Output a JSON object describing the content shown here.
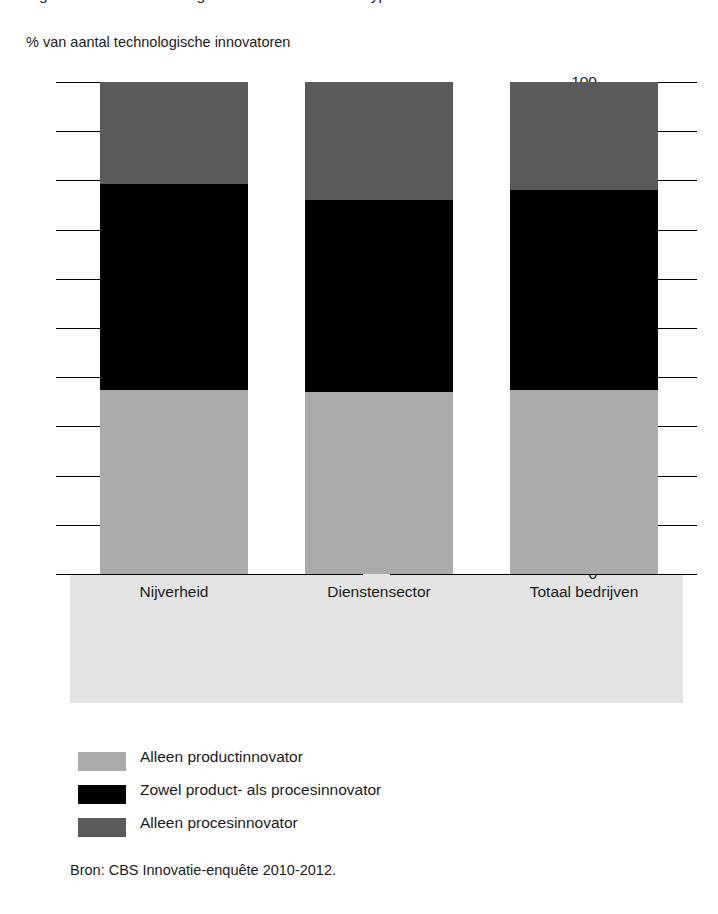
{
  "top_clipped_line": "Figuur: aandeel technologische innovatoren naar type innovatie",
  "axis_caption": "% van aantal technologische innovatoren",
  "source_note": "Bron: CBS Innovatie-enquête 2010-2012.",
  "colors": {
    "product_only": "#aaaaaa",
    "both": "#000000",
    "process_only": "#5a5a5a",
    "panel_background": "#e3e3e3",
    "axis": "#000000"
  },
  "legend": {
    "position": "bottom-left",
    "items": [
      {
        "label": "Alleen productinnovator",
        "color": "#aaaaaa",
        "swatch": "legend-swatch-product"
      },
      {
        "label": "Zowel product- als procesinnovator",
        "color": "#000000",
        "swatch": "legend-swatch-both"
      },
      {
        "label": "Alleen procesinnovator",
        "color": "#5a5a5a",
        "swatch": "legend-swatch-process"
      }
    ]
  },
  "chart_data": {
    "type": "bar",
    "subtype": "stacked-100-percent",
    "title": "",
    "xlabel": "",
    "ylabel": "% van aantal technologische innovatoren",
    "ylim": [
      0,
      100
    ],
    "yticks": [
      0,
      10,
      20,
      30,
      40,
      50,
      60,
      70,
      80,
      90,
      100
    ],
    "ytick_labels": [
      "0",
      "10",
      "20",
      "30",
      "40",
      "50",
      "60",
      "70",
      "80",
      "90",
      "100"
    ],
    "grid": false,
    "categories": [
      "Nijverheid",
      "Dienstensector",
      "Totaal bedrijven"
    ],
    "series": [
      {
        "name": "Alleen productinnovator",
        "color": "#aaaaaa",
        "values": [
          37.4,
          37.0,
          37.4
        ]
      },
      {
        "name": "Zowel product- als procesinnovator",
        "color": "#000000",
        "values": [
          41.9,
          39.0,
          40.6
        ]
      },
      {
        "name": "Alleen procesinnovator",
        "color": "#5a5a5a",
        "values": [
          20.7,
          24.0,
          22.0
        ]
      }
    ],
    "cumulative_tops": {
      "Nijverheid": {
        "product_only": 37.4,
        "through_both": 79.3,
        "through_process": 100
      },
      "Dienstensector": {
        "product_only": 37.0,
        "through_both": 76.0,
        "through_process": 100
      },
      "Totaal bedrijven": {
        "product_only": 37.4,
        "through_both": 78.0,
        "through_process": 100
      }
    }
  }
}
